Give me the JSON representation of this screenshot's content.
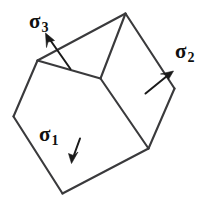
{
  "figure": {
    "background_color": "#ffffff",
    "line_color": "#3a3a3c",
    "arrow_color": "#1a1a1a",
    "width": 210,
    "height": 203
  },
  "cube": {
    "name": "stress-element-cube",
    "vertices": {
      "top": [
        125,
        13
      ],
      "top_left": [
        37,
        60
      ],
      "center": [
        100,
        78
      ],
      "right": [
        174,
        88
      ],
      "left": [
        13,
        116
      ],
      "bottom_right": [
        148,
        148
      ],
      "bottom": [
        62,
        193
      ]
    },
    "visible_faces": [
      "top-face",
      "left-front-face",
      "right-front-face"
    ]
  },
  "labels": {
    "sigma1": {
      "symbol": "σ",
      "subscript": "1"
    },
    "sigma2": {
      "symbol": "σ",
      "subscript": "2"
    },
    "sigma3": {
      "symbol": "σ",
      "subscript": "3"
    }
  },
  "arrows": {
    "sigma1": {
      "direction": "down",
      "from": [
        80,
        139
      ],
      "to": [
        72,
        163
      ]
    },
    "sigma2": {
      "direction": "up-right",
      "from": [
        146,
        93
      ],
      "to": [
        172,
        72
      ]
    },
    "sigma3": {
      "direction": "up-left",
      "from": [
        70,
        69
      ],
      "to": [
        46,
        35
      ]
    }
  }
}
